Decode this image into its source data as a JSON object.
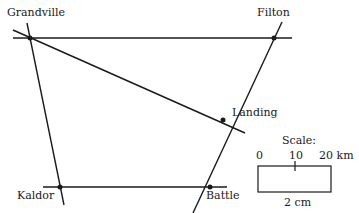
{
  "diagram": {
    "type": "map",
    "towns": [
      {
        "name": "Grandville",
        "x": 30,
        "y": 38
      },
      {
        "name": "Filton",
        "x": 274,
        "y": 38
      },
      {
        "name": "Landing",
        "x": 223,
        "y": 120
      },
      {
        "name": "Kaldor",
        "x": 60,
        "y": 187
      },
      {
        "name": "Battle",
        "x": 210,
        "y": 187
      }
    ],
    "roads": [
      {
        "from": "Grandville",
        "to": "Filton"
      },
      {
        "from": "Grandville",
        "to": "Landing"
      },
      {
        "from": "Grandville",
        "to": "Kaldor"
      },
      {
        "from": "Filton",
        "to": "Battle"
      },
      {
        "from": "Kaldor",
        "to": "Battle"
      }
    ],
    "scale": {
      "title": "Scale:",
      "ticks": [
        "0",
        "10",
        "20 km"
      ],
      "bar_length_label": "2 cm"
    }
  }
}
